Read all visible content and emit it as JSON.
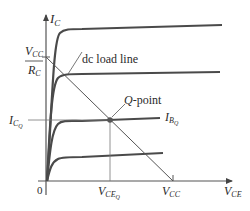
{
  "diagram": {
    "type": "transistor-characteristic-curves",
    "y_axis": {
      "label_main": "I",
      "label_sub": "C"
    },
    "x_axis": {
      "label_main": "V",
      "label_sub": "CE"
    },
    "origin_label": "0",
    "y_intercept_label": {
      "num_main": "V",
      "num_sub": "CC",
      "den_main": "R",
      "den_sub": "C"
    },
    "x_intercept_label": {
      "main": "V",
      "sub": "CC"
    },
    "load_line_label": "dc load line",
    "q_point_label": "Q-point",
    "q_point_label_prefix": "Q",
    "q_point_label_suffix": "-point",
    "icq_label": {
      "main": "I",
      "sub": "C",
      "subsub": "Q"
    },
    "vceq_label": {
      "main": "V",
      "sub": "CE",
      "subsub": "Q"
    },
    "ibq_label": {
      "main": "I",
      "sub": "B",
      "subsub": "Q"
    },
    "curve_levels_count": 4,
    "colors": {
      "curve": "#4a4a4a",
      "axis": "#555555",
      "load_line": "#555555",
      "q_point": "#555555"
    }
  }
}
